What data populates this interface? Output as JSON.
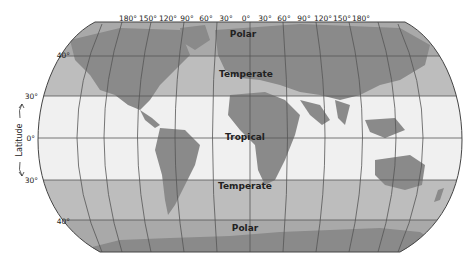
{
  "map": {
    "title": "Climate zones by latitude",
    "longitude_labels": [
      "180°",
      "150°",
      "120°",
      "90°",
      "60°",
      "30°",
      "0°",
      "30°",
      "60°",
      "90°",
      "120°",
      "150°",
      "180°"
    ],
    "latitude_labels": {
      "north_40": "40°",
      "north_30": "30°",
      "equator": "0°",
      "south_30": "30°",
      "south_40": "40°"
    },
    "axis_label": "Latitude",
    "zones": {
      "polar_north": "Polar",
      "temperate_north": "Temperate",
      "tropical": "Tropical",
      "temperate_south": "Temperate",
      "polar_south": "Polar"
    },
    "colors": {
      "polar": "#a9a9a9",
      "temperate": "#bdbdbd",
      "tropical": "#f0f0f0",
      "land": "#8a8a8a",
      "grid": "#555555"
    }
  }
}
